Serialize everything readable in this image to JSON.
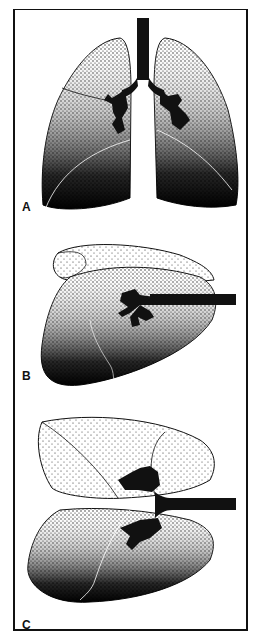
{
  "figure": {
    "panels": [
      {
        "label": "A",
        "view": "upright frontal view, both lungs with trachea and bronchi"
      },
      {
        "label": "B",
        "view": "lateral decubitus / side view, lungs superimposed with main bronchus extending right"
      },
      {
        "label": "C",
        "view": "lateral decubitus view, lungs separated with bronchus extending right"
      }
    ]
  },
  "colors": {
    "ink": "#111111",
    "paper": "#ffffff"
  }
}
